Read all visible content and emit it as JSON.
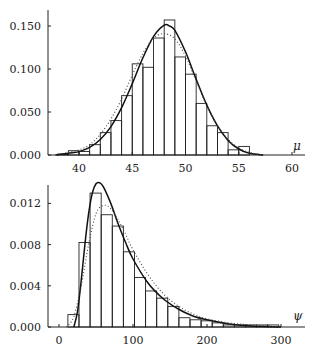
{
  "chart_data": [
    {
      "type": "bar",
      "title": "",
      "xlabel": "μ",
      "ylabel": "",
      "xlim": [
        37,
        61
      ],
      "ylim": [
        0,
        0.165
      ],
      "xticks": [
        40,
        45,
        50,
        55,
        60
      ],
      "xtick_labels": [
        "40",
        "45",
        "50",
        "55",
        "60"
      ],
      "yticks": [
        0.0,
        0.05,
        0.1,
        0.15
      ],
      "ytick_labels": [
        "0.000",
        "0.050",
        "0.100",
        "0.150"
      ],
      "grid": false,
      "legend": null,
      "histogram": {
        "bin_edges": [
          38,
          39,
          40,
          41,
          42,
          43,
          44,
          45,
          46,
          47,
          48,
          49,
          50,
          51,
          52,
          53,
          54,
          55,
          56
        ],
        "values": [
          0.001,
          0.005,
          0.004,
          0.012,
          0.026,
          0.04,
          0.069,
          0.106,
          0.102,
          0.136,
          0.157,
          0.114,
          0.094,
          0.06,
          0.034,
          0.026,
          0.006,
          0.01
        ]
      },
      "series": [
        {
          "name": "solid density curve",
          "style": "solid",
          "x": [
            37.8,
            39,
            40,
            41,
            42,
            43,
            44,
            45,
            46,
            47,
            48,
            48.5,
            49,
            50,
            51,
            52,
            53,
            54,
            55,
            56,
            57.3
          ],
          "values": [
            0.0,
            0.002,
            0.004,
            0.009,
            0.018,
            0.033,
            0.055,
            0.083,
            0.113,
            0.138,
            0.151,
            0.15,
            0.145,
            0.12,
            0.088,
            0.058,
            0.034,
            0.017,
            0.007,
            0.002,
            0.0
          ]
        },
        {
          "name": "dotted density curve",
          "style": "dotted",
          "x": [
            37.8,
            39,
            40,
            41,
            42,
            43,
            44,
            45,
            46,
            47,
            48,
            49,
            50,
            51,
            52,
            53,
            54,
            55,
            56,
            57.3
          ],
          "values": [
            0.0,
            0.003,
            0.006,
            0.012,
            0.024,
            0.042,
            0.065,
            0.093,
            0.118,
            0.136,
            0.141,
            0.135,
            0.115,
            0.086,
            0.057,
            0.034,
            0.018,
            0.008,
            0.003,
            0.0
          ]
        }
      ]
    },
    {
      "type": "bar",
      "title": "",
      "xlabel": "ψ",
      "ylabel": "",
      "xlim": [
        -15,
        335
      ],
      "ylim": [
        0,
        0.0142
      ],
      "xticks": [
        0,
        100,
        200,
        300
      ],
      "xtick_labels": [
        "0",
        "100",
        "200",
        "300"
      ],
      "yticks": [
        0.0,
        0.004,
        0.008,
        0.012
      ],
      "ytick_labels": [
        "0.000",
        "0.004",
        "0.008",
        "0.012"
      ],
      "grid": false,
      "legend": null,
      "histogram": {
        "bin_edges": [
          12,
          27,
          42,
          57,
          72,
          87,
          102,
          117,
          132,
          147,
          162,
          177,
          192,
          207,
          222,
          237,
          252,
          267,
          282,
          297
        ],
        "values": [
          0.0012,
          0.0082,
          0.013,
          0.0109,
          0.0098,
          0.0073,
          0.0048,
          0.0035,
          0.0028,
          0.002,
          0.0009,
          0.0007,
          0.0006,
          0.0004,
          0.0002,
          0.0002,
          0.0002,
          0.0002,
          0.0002
        ]
      },
      "series": [
        {
          "name": "solid density curve",
          "style": "solid",
          "x": [
            20,
            25,
            30,
            35,
            40,
            45,
            50,
            55,
            60,
            70,
            80,
            90,
            100,
            120,
            140,
            160,
            180,
            200,
            230,
            260,
            300
          ],
          "values": [
            0.0,
            0.0015,
            0.0045,
            0.008,
            0.011,
            0.013,
            0.0139,
            0.014,
            0.0136,
            0.012,
            0.01,
            0.0082,
            0.0066,
            0.0043,
            0.0028,
            0.0018,
            0.0011,
            0.0007,
            0.0003,
            0.0001,
            0.0
          ]
        },
        {
          "name": "dotted density curve",
          "style": "dotted",
          "x": [
            10,
            20,
            30,
            40,
            50,
            60,
            70,
            80,
            90,
            100,
            120,
            140,
            160,
            180,
            200,
            230,
            260,
            300
          ],
          "values": [
            0.0,
            0.001,
            0.004,
            0.008,
            0.011,
            0.0118,
            0.0115,
            0.0104,
            0.009,
            0.0075,
            0.0051,
            0.0033,
            0.0021,
            0.0013,
            0.0008,
            0.0004,
            0.0002,
            0.0
          ]
        }
      ]
    }
  ]
}
